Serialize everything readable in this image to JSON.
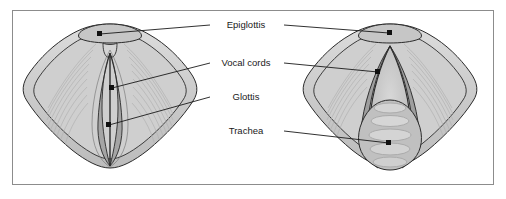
{
  "figure": {
    "border_color": "#8c8c8c",
    "background_color": "#ffffff"
  },
  "labels": [
    {
      "id": "epiglottis",
      "text": "Epiglottis",
      "x": 246,
      "y": 28,
      "leader_left": true,
      "leader_right": true
    },
    {
      "id": "vocal-cords",
      "text": "Vocal cords",
      "x": 246,
      "y": 66,
      "leader_left": true,
      "leader_right": true
    },
    {
      "id": "glottis",
      "text": "Glottis",
      "x": 246,
      "y": 100,
      "leader_left": true,
      "leader_right": false
    },
    {
      "id": "trachea",
      "text": "Trachea",
      "x": 246,
      "y": 134,
      "leader_left": false,
      "leader_right": true
    }
  ],
  "views": [
    {
      "id": "left-view",
      "name": "closed-glottis-view",
      "description": "Vocal cords adducted, glottis closed as a narrow vertical slit",
      "center_x": 110,
      "center_y": 98
    },
    {
      "id": "right-view",
      "name": "open-glottis-view",
      "description": "Vocal cords abducted, glottis open showing tracheal rings",
      "center_x": 390,
      "center_y": 98
    }
  ],
  "colors": {
    "outline": "#2b2b2b",
    "tissue_light": "#d2d2d2",
    "tissue_mid": "#bdbdbd",
    "tissue_dark": "#9e9e9e",
    "cord_gray": "#a8a8a8",
    "glottis_dark": "#8f8f8f",
    "leader_line": "#1a1a1a",
    "label_text": "#1a1a1a",
    "border": "#8c8c8c"
  },
  "anatomy_parts": [
    {
      "id": "epiglottis-cap",
      "name": "epiglottis"
    },
    {
      "id": "vocal-cord-left",
      "name": "left-vocal-cord"
    },
    {
      "id": "vocal-cord-right",
      "name": "right-vocal-cord"
    },
    {
      "id": "glottis-opening",
      "name": "glottis"
    },
    {
      "id": "trachea-rings",
      "name": "trachea"
    },
    {
      "id": "aryepiglottic-fold",
      "name": "aryepiglottic-fold"
    }
  ]
}
